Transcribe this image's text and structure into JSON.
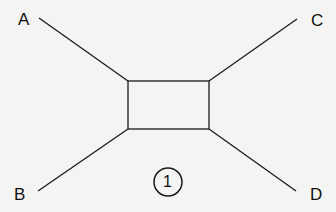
{
  "diagram": {
    "labels": {
      "a": "A",
      "b": "B",
      "c": "C",
      "d": "D"
    },
    "figure_number": "1",
    "colors": {
      "background": "#f4f4f2",
      "stroke": "#1a1a1a"
    }
  }
}
